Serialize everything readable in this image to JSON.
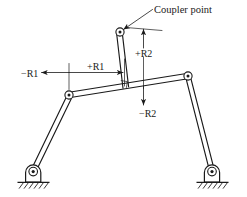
{
  "figure": {
    "title_visible": false,
    "background_color": "#ffffff",
    "line_color": "#1a1a1a",
    "type": "fourbar-linkage-coupler-diagram"
  },
  "labels": {
    "coupler_point": "Coupler point",
    "minus_r1": "−R1",
    "plus_r1": "+R1",
    "plus_r2": "+R2",
    "minus_r2": "−R2"
  },
  "geometry": {
    "coupler_point": {
      "x": 120,
      "y": 32
    },
    "left_joint": {
      "x": 69,
      "y": 95
    },
    "right_joint": {
      "x": 188,
      "y": 76
    },
    "left_ground_pivot": {
      "x": 33,
      "y": 170
    },
    "right_ground_pivot": {
      "x": 212,
      "y": 170
    },
    "r2_foot": {
      "x": 126,
      "y": 87
    }
  },
  "elements": {
    "coupler_point_joint": "coupler-point-joint",
    "left_coupler_joint": "left-coupler-joint",
    "right_coupler_joint": "right-coupler-joint",
    "left_crank": "left-crank-link",
    "right_crank": "right-crank-link",
    "coupler_link": "coupler-link",
    "coupler_offset_link": "coupler-offset-link",
    "left_support": "left-ground-support",
    "right_support": "right-ground-support",
    "right_angle_marker": "right-angle-marker",
    "leader_line": "coupler-point-leader-line"
  },
  "dimensions": {
    "r1_description": "horizontal dimension along coupler link, positive to the right, negative to the left",
    "r2_description": "vertical dimension perpendicular to coupler link, positive upward, negative downward"
  }
}
